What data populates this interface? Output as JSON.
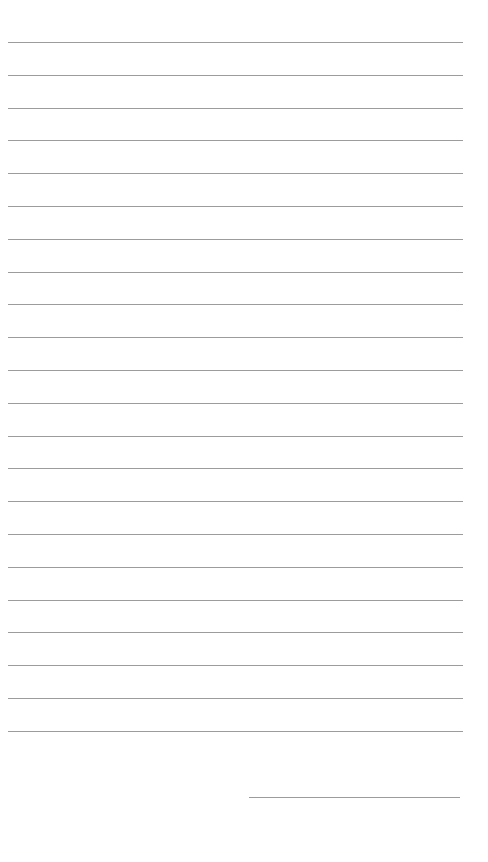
{
  "page": {
    "type": "lined-notepaper",
    "background_color": "#ffffff",
    "line_color": "#9c9c9c",
    "ruled_lines": {
      "count": 22,
      "first_y": 42,
      "spacing": 32.8,
      "left": 8,
      "right": 463
    },
    "signature_line": {
      "left": 249,
      "right": 460,
      "y": 797
    }
  }
}
